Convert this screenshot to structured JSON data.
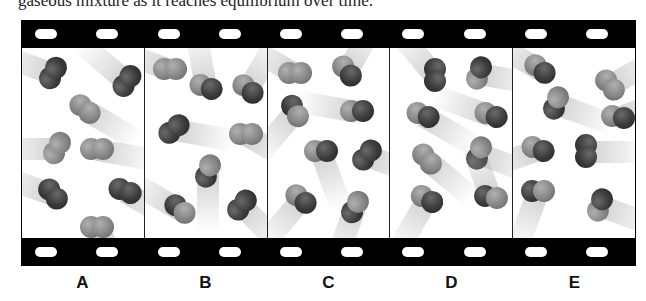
{
  "caption": "gaseous mixture as it reaches equilibrium over time.",
  "film": {
    "sprocket_holes_top_x": [
      14,
      75,
      137,
      198,
      259,
      320,
      381,
      443,
      504,
      565
    ],
    "sprocket_holes_bottom_x": [
      14,
      75,
      137,
      198,
      259,
      320,
      381,
      443,
      504,
      565
    ]
  },
  "frames": [
    {
      "label": "A",
      "molecules": [
        {
          "x": 14,
          "y": 14,
          "rot": -60,
          "a": "dark",
          "b": "dark",
          "trail": 200
        },
        {
          "x": 88,
          "y": 22,
          "rot": -55,
          "a": "dark",
          "b": "dark",
          "trail": 220
        },
        {
          "x": 46,
          "y": 50,
          "rot": 40,
          "a": "light",
          "b": "light",
          "trail": 30
        },
        {
          "x": 18,
          "y": 89,
          "rot": -60,
          "a": "light",
          "b": "light",
          "trail": 180
        },
        {
          "x": 58,
          "y": 90,
          "rot": 0,
          "a": "light",
          "b": "light",
          "trail": 10
        },
        {
          "x": 14,
          "y": 135,
          "rot": 50,
          "a": "dark",
          "b": "dark",
          "trail": 200
        },
        {
          "x": 86,
          "y": 132,
          "rot": 20,
          "a": "dark",
          "b": "dark",
          "trail": 30
        },
        {
          "x": 58,
          "y": 168,
          "rot": 0,
          "a": "light",
          "b": "light",
          "trail": 60
        }
      ]
    },
    {
      "label": "B",
      "molecules": [
        {
          "x": 8,
          "y": 10,
          "rot": 0,
          "a": "light",
          "b": "light",
          "trail": 200
        },
        {
          "x": 44,
          "y": 28,
          "rot": 20,
          "a": "light",
          "b": "dark",
          "trail": 260
        },
        {
          "x": 86,
          "y": 30,
          "rot": 40,
          "a": "light",
          "b": "dark",
          "trail": 300
        },
        {
          "x": 12,
          "y": 70,
          "rot": -40,
          "a": "dark",
          "b": "dark",
          "trail": 10
        },
        {
          "x": 84,
          "y": 75,
          "rot": 0,
          "a": "light",
          "b": "light",
          "trail": 30
        },
        {
          "x": 46,
          "y": 112,
          "rot": -70,
          "a": "dark",
          "b": "light",
          "trail": 90
        },
        {
          "x": 18,
          "y": 150,
          "rot": 40,
          "a": "dark",
          "b": "light",
          "trail": 210
        },
        {
          "x": 80,
          "y": 146,
          "rot": -50,
          "a": "dark",
          "b": "dark",
          "trail": 45
        }
      ]
    },
    {
      "label": "C",
      "molecules": [
        {
          "x": 10,
          "y": 14,
          "rot": 0,
          "a": "light",
          "b": "light",
          "trail": 210
        },
        {
          "x": 62,
          "y": 12,
          "rot": 50,
          "a": "light",
          "b": "dark",
          "trail": 300
        },
        {
          "x": 10,
          "y": 52,
          "rot": 60,
          "a": "dark",
          "b": "light",
          "trail": 130
        },
        {
          "x": 72,
          "y": 52,
          "rot": 0,
          "a": "light",
          "b": "dark",
          "trail": 190
        },
        {
          "x": 36,
          "y": 92,
          "rot": 0,
          "a": "light",
          "b": "dark",
          "trail": 70
        },
        {
          "x": 82,
          "y": 96,
          "rot": -50,
          "a": "dark",
          "b": "dark",
          "trail": 20
        },
        {
          "x": 16,
          "y": 140,
          "rot": 40,
          "a": "light",
          "b": "dark",
          "trail": 130
        },
        {
          "x": 70,
          "y": 148,
          "rot": -60,
          "a": "dark",
          "b": "light",
          "trail": 110
        }
      ]
    },
    {
      "label": "D",
      "molecules": [
        {
          "x": 28,
          "y": 16,
          "rot": 90,
          "a": "dark",
          "b": "dark",
          "trail": 230
        },
        {
          "x": 72,
          "y": 14,
          "rot": -70,
          "a": "light",
          "b": "dark",
          "trail": 10
        },
        {
          "x": 16,
          "y": 56,
          "rot": 20,
          "a": "light",
          "b": "dark",
          "trail": 30
        },
        {
          "x": 84,
          "y": 56,
          "rot": 20,
          "a": "light",
          "b": "dark",
          "trail": 200
        },
        {
          "x": 72,
          "y": 94,
          "rot": -70,
          "a": "dark",
          "b": "light",
          "trail": 20
        },
        {
          "x": 20,
          "y": 100,
          "rot": 50,
          "a": "light",
          "b": "light",
          "trail": 40
        },
        {
          "x": 20,
          "y": 140,
          "rot": 30,
          "a": "light",
          "b": "dark",
          "trail": 120
        },
        {
          "x": 84,
          "y": 138,
          "rot": 10,
          "a": "dark",
          "b": "light",
          "trail": 250
        }
      ]
    },
    {
      "label": "E",
      "molecules": [
        {
          "x": 10,
          "y": 10,
          "rot": 40,
          "a": "light",
          "b": "dark",
          "trail": 210
        },
        {
          "x": 80,
          "y": 26,
          "rot": 50,
          "a": "light",
          "b": "light",
          "trail": -30
        },
        {
          "x": 26,
          "y": 44,
          "rot": -70,
          "a": "dark",
          "b": "light",
          "trail": 20
        },
        {
          "x": 88,
          "y": 58,
          "rot": 10,
          "a": "light",
          "b": "dark",
          "trail": -20
        },
        {
          "x": 8,
          "y": 90,
          "rot": 20,
          "a": "light",
          "b": "dark",
          "trail": 160
        },
        {
          "x": 56,
          "y": 92,
          "rot": 90,
          "a": "dark",
          "b": "dark",
          "trail": 0
        },
        {
          "x": 8,
          "y": 132,
          "rot": 0,
          "a": "dark",
          "b": "light",
          "trail": 110
        },
        {
          "x": 70,
          "y": 146,
          "rot": -70,
          "a": "light",
          "b": "dark",
          "trail": 20
        }
      ]
    }
  ]
}
